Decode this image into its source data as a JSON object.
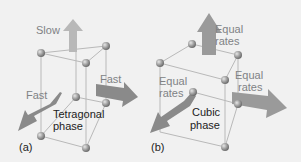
{
  "panel_a": {
    "tag": "(a)",
    "arrow_up_label": "Slow",
    "arrow_right_label": "Fast",
    "arrow_left_label": "Fast",
    "phase_line1": "Tetragonal",
    "phase_line2": "phase"
  },
  "panel_b": {
    "tag": "(b)",
    "arrow_up_label_line1": "Equal",
    "arrow_up_label_line2": "rates",
    "arrow_right_label_line1": "Equal",
    "arrow_right_label_line2": "rates",
    "arrow_left_label_line1": "Equal",
    "arrow_left_label_line2": "rates",
    "phase_line1": "Cubic",
    "phase_line2": "phase"
  },
  "colors": {
    "background": "#f1f1f1",
    "lattice_line": "#b9b9b9",
    "atom": "#9a9a9a",
    "arrow_light": "#b8b8b8",
    "arrow_dark": "#7f7f7f",
    "label_gray": "#808285",
    "label_dark": "#222222"
  }
}
